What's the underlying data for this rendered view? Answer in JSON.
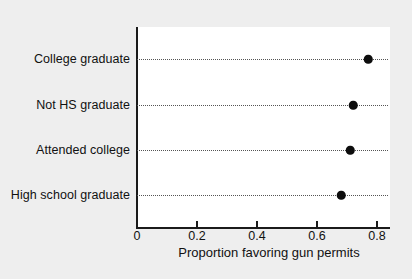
{
  "chart_data": {
    "type": "scatter",
    "subtype": "dot-plot",
    "title": "",
    "xlabel": "Proportion favoring gun permits",
    "ylabel": "",
    "categories": [
      "College graduate",
      "Not HS graduate",
      "Attended college",
      "High school graduate"
    ],
    "values": [
      0.77,
      0.72,
      0.71,
      0.68
    ],
    "points": [
      {
        "category": "College graduate",
        "value": 0.77
      },
      {
        "category": "Not HS graduate",
        "value": 0.72
      },
      {
        "category": "Attended college",
        "value": 0.71
      },
      {
        "category": "High school graduate",
        "value": 0.68
      }
    ],
    "xlim": [
      0,
      0.845
    ],
    "xticks": [
      0,
      0.2,
      0.4,
      0.6,
      0.8
    ],
    "xtick_labels": [
      "0",
      "0.2",
      "0.4",
      "0.6",
      "0.8"
    ],
    "grid": "dotted-horizontal",
    "legend": "none",
    "marker": "filled-circle",
    "marker_color": "#0d0d0d",
    "plot_background": "#ffffff",
    "figure_background": "#eeeeee",
    "axis_color": "#1a1a1a",
    "gridline_color": "#555555"
  },
  "axis": {
    "x_title": "Proportion favoring gun permits",
    "ticks": [
      {
        "label": "0",
        "value": 0
      },
      {
        "label": "0.2",
        "value": 0.2
      },
      {
        "label": "0.4",
        "value": 0.4
      },
      {
        "label": "0.6",
        "value": 0.6
      },
      {
        "label": "0.8",
        "value": 0.8
      }
    ]
  },
  "rows": [
    {
      "label": "College graduate",
      "value": 0.77
    },
    {
      "label": "Not HS graduate",
      "value": 0.72
    },
    {
      "label": "Attended college",
      "value": 0.71
    },
    {
      "label": "High school graduate",
      "value": 0.68
    }
  ]
}
